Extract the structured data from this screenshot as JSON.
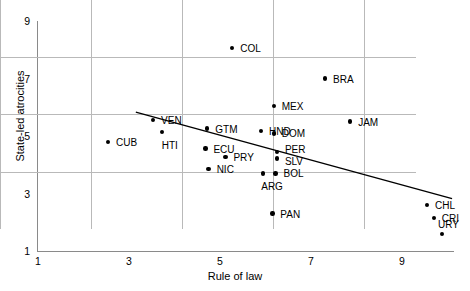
{
  "chart_data": {
    "type": "scatter",
    "title": "",
    "xlabel": "Rule of law",
    "ylabel": "State-led atrocities",
    "xlim": [
      1,
      10.2
    ],
    "ylim": [
      1,
      9
    ],
    "xticks": [
      1,
      3,
      5,
      7,
      9
    ],
    "yticks": [
      1,
      3,
      5,
      7,
      9
    ],
    "grid": true,
    "legend": "none",
    "point_labels_shown": true,
    "trendline": {
      "type": "linear",
      "x_start": 3.15,
      "y_start": 5.83,
      "x_end": 10.1,
      "y_end": 2.82
    },
    "points": [
      {
        "label": "CUB",
        "x": 2.54,
        "y": 4.79,
        "lx": 8,
        "ly": -4
      },
      {
        "label": "VEN",
        "x": 3.53,
        "y": 5.55,
        "lx": 8,
        "ly": -4
      },
      {
        "label": "HTI",
        "x": 3.72,
        "y": 5.13,
        "lx": 0,
        "ly": 9
      },
      {
        "label": "ECU",
        "x": 4.68,
        "y": 4.56,
        "lx": 8,
        "ly": -4
      },
      {
        "label": "NIC",
        "x": 4.75,
        "y": 3.86,
        "lx": 8,
        "ly": -4
      },
      {
        "label": "GTM",
        "x": 4.72,
        "y": 5.26,
        "lx": 8,
        "ly": -4
      },
      {
        "label": "PRY",
        "x": 5.12,
        "y": 4.28,
        "lx": 8,
        "ly": -4
      },
      {
        "label": "COL",
        "x": 5.27,
        "y": 8.06,
        "lx": 8,
        "ly": -4
      },
      {
        "label": "HND",
        "x": 5.9,
        "y": 5.18,
        "lx": 8,
        "ly": -4
      },
      {
        "label": "ARG",
        "x": 5.95,
        "y": 3.7,
        "lx": -2,
        "ly": 9
      },
      {
        "label": "PAN",
        "x": 6.15,
        "y": 2.3,
        "lx": 8,
        "ly": -4
      },
      {
        "label": "MEX",
        "x": 6.18,
        "y": 6.04,
        "lx": 8,
        "ly": -4
      },
      {
        "label": "DOM",
        "x": 6.18,
        "y": 5.09,
        "lx": 8,
        "ly": -4
      },
      {
        "label": "BOL",
        "x": 6.22,
        "y": 3.7,
        "lx": 8,
        "ly": -4
      },
      {
        "label": "PER",
        "x": 6.25,
        "y": 4.45,
        "lx": 8,
        "ly": -7
      },
      {
        "label": "SLV",
        "x": 6.25,
        "y": 4.22,
        "lx": 8,
        "ly": -1
      },
      {
        "label": "BRA",
        "x": 7.31,
        "y": 7.0,
        "lx": 8,
        "ly": -4
      },
      {
        "label": "JAM",
        "x": 7.86,
        "y": 5.5,
        "lx": 8,
        "ly": -4
      },
      {
        "label": "CHL",
        "x": 9.55,
        "y": 2.6,
        "lx": 8,
        "ly": -4
      },
      {
        "label": "CRI",
        "x": 9.7,
        "y": 2.15,
        "lx": 8,
        "ly": -4
      },
      {
        "label": "URY",
        "x": 9.88,
        "y": 1.6,
        "lx": -4,
        "ly": -14
      }
    ]
  }
}
